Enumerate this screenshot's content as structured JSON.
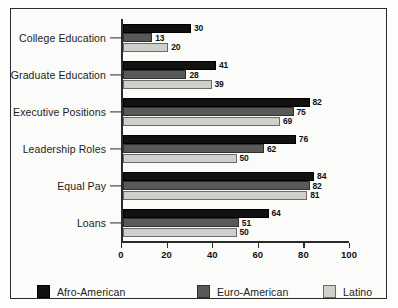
{
  "chart_data": {
    "type": "bar",
    "orientation": "horizontal",
    "title": "",
    "xlabel": "",
    "ylabel": "",
    "xlim": [
      0,
      100
    ],
    "xticks": [
      0,
      20,
      40,
      60,
      80,
      100
    ],
    "grid": false,
    "legend_position": "bottom",
    "categories": [
      "College Education",
      "Graduate Education",
      "Executive Positions",
      "Leadership Roles",
      "Equal Pay",
      "Loans"
    ],
    "series": [
      {
        "name": "Afro-American",
        "color": "#111111",
        "values": [
          30,
          41,
          82,
          76,
          84,
          64
        ]
      },
      {
        "name": "Euro-American",
        "color": "#595959",
        "values": [
          13,
          28,
          75,
          62,
          82,
          51
        ]
      },
      {
        "name": "Latino",
        "color": "#cfcfcb",
        "values": [
          20,
          39,
          69,
          50,
          81,
          50
        ]
      }
    ]
  },
  "legend": {
    "items": [
      {
        "label": "Afro-American",
        "swatch": "legend-swatch-afro-american"
      },
      {
        "label": "Euro-American",
        "swatch": "legend-swatch-euro-american"
      },
      {
        "label": "Latino",
        "swatch": "legend-swatch-latino"
      }
    ]
  }
}
